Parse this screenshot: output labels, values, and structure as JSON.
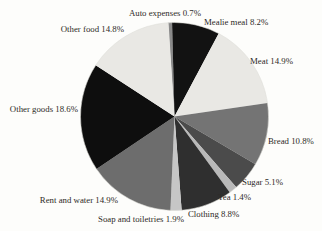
{
  "page": {
    "background_color": "#fdfdfb",
    "text_color": "#2e2b27"
  },
  "chart_data": {
    "type": "pie",
    "title": "",
    "unit": "%",
    "slices": [
      {
        "label": "Auto expenses",
        "value": 0.7,
        "color": "#8a8a8a"
      },
      {
        "label": "Mealie meal",
        "value": 8.2,
        "color": "#121212"
      },
      {
        "label": "Meat",
        "value": 14.9,
        "color": "#e9e8e4"
      },
      {
        "label": "Bread",
        "value": 10.8,
        "color": "#747474"
      },
      {
        "label": "Sugar",
        "value": 5.1,
        "color": "#4b4b4b"
      },
      {
        "label": "Tea",
        "value": 1.4,
        "color": "#b9b9b9"
      },
      {
        "label": "Clothing",
        "value": 8.8,
        "color": "#2f2f2f"
      },
      {
        "label": "Soap and toiletries",
        "value": 1.9,
        "color": "#c6c6c6"
      },
      {
        "label": "Rent and water",
        "value": 14.9,
        "color": "#6d6d6d"
      },
      {
        "label": "Other goods",
        "value": 18.6,
        "color": "#0e0e0e"
      },
      {
        "label": "Other food",
        "value": 14.8,
        "color": "#e9e8e4"
      }
    ],
    "label_format": "{label} {value}%",
    "layout": {
      "start_angle_deg": -4,
      "direction": "clockwise",
      "legend": "none",
      "labels": "outside",
      "grid": "off"
    }
  }
}
